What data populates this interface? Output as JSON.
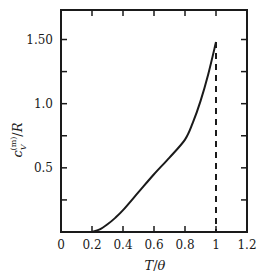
{
  "chart_data": {
    "type": "line",
    "title": "",
    "xlabel": "T/θ",
    "ylabel": "c_V^(m)/R",
    "xlim": [
      0,
      1.2
    ],
    "ylim": [
      0,
      1.73
    ],
    "grid": false,
    "legend": null,
    "x_ticks": [
      0,
      0.2,
      0.4,
      0.6,
      0.8,
      1.0,
      1.2
    ],
    "x_tick_labels": [
      "0",
      "0.2",
      "0.4",
      "0.6",
      "0.8",
      "1",
      "1.2"
    ],
    "y_ticks": [
      0.25,
      0.5,
      0.75,
      1.0,
      1.25,
      1.5
    ],
    "y_tick_labels": [
      "",
      "0.5",
      "",
      "1.0",
      "",
      "1.50"
    ],
    "series": [
      {
        "name": "magnetic specific heat",
        "style": "solid",
        "x": [
          0.2,
          0.25,
          0.3,
          0.35,
          0.4,
          0.5,
          0.6,
          0.7,
          0.8,
          0.85,
          0.9,
          0.95,
          1.0
        ],
        "values": [
          0.0,
          0.02,
          0.06,
          0.11,
          0.17,
          0.31,
          0.45,
          0.58,
          0.72,
          0.85,
          1.02,
          1.23,
          1.48
        ]
      },
      {
        "name": "drop at transition",
        "style": "dashed",
        "x": [
          1.0,
          1.0
        ],
        "values": [
          1.48,
          0.0
        ]
      },
      {
        "name": "zero above transition",
        "style": "solid",
        "x": [
          1.0,
          1.2
        ],
        "values": [
          0.0,
          0.0
        ]
      }
    ],
    "annotations": []
  },
  "axes": {
    "x_label_main": "T",
    "x_label_sep": "/",
    "x_label_sub": "θ",
    "y_label_c": "c",
    "y_label_sub": "V",
    "y_label_sup": "(m)",
    "y_label_tail": "/R"
  }
}
